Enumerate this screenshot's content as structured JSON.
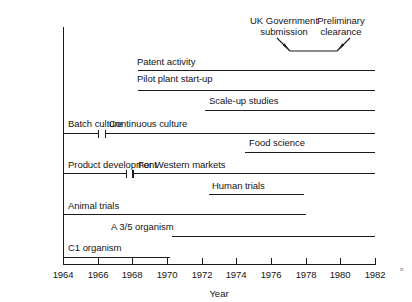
{
  "figure": {
    "axis": {
      "x_label": "Year",
      "x_min": 1964,
      "x_max": 1982,
      "ticks": [
        1964,
        1966,
        1968,
        1970,
        1972,
        1974,
        1976,
        1978,
        1980,
        1982
      ],
      "tick_labels": [
        "1964",
        "1966",
        "1968",
        "1970",
        "1972",
        "1974",
        "1976",
        "1978",
        "1980",
        "1982"
      ]
    },
    "annotations": [
      {
        "name": "uk-government-submission",
        "text": "UK Government\nsubmission",
        "at_year": 1976.7
      },
      {
        "name": "preliminary-clearance",
        "text": "Preliminary\nclearance",
        "at_year": 1980.0
      }
    ],
    "corner_mark": "¤"
  },
  "chart_data": {
    "type": "bar",
    "orientation": "horizontal-timeline",
    "title": "",
    "xlabel": "Year",
    "ylabel": "",
    "xlim": [
      1964,
      1982
    ],
    "grid": false,
    "legend": "none",
    "tasks": [
      {
        "label": "Patent activity",
        "start": 1968.3,
        "end": 1982.0,
        "cap_start": false,
        "cap_end": false
      },
      {
        "label": "Pilot plant start-up",
        "start": 1968.3,
        "end": 1982.0,
        "cap_start": false,
        "cap_end": false
      },
      {
        "label": "Scale-up studies",
        "start": 1972.2,
        "end": 1982.0,
        "cap_start": false,
        "cap_end": false
      },
      {
        "label": "Batch culture",
        "start": 1964.0,
        "end": 1966.1,
        "cap_start": false,
        "cap_end": true
      },
      {
        "label": "Continuous culture",
        "start": 1966.4,
        "end": 1982.0,
        "cap_start": true,
        "cap_end": false
      },
      {
        "label": "Food science",
        "start": 1974.5,
        "end": 1982.0,
        "cap_start": false,
        "cap_end": false
      },
      {
        "label": "Product development",
        "start": 1964.0,
        "end": 1967.7,
        "cap_start": false,
        "cap_end": true
      },
      {
        "label": "For Western markets",
        "start": 1968.0,
        "end": 1982.0,
        "cap_start": true,
        "cap_end": false
      },
      {
        "label": "Human trials",
        "start": 1972.4,
        "end": 1977.9,
        "cap_start": false,
        "cap_end": false
      },
      {
        "label": "Animal trials",
        "start": 1964.0,
        "end": 1978.0,
        "cap_start": false,
        "cap_end": false
      },
      {
        "label": "A 3/5 organism",
        "start": 1970.3,
        "end": 1982.0,
        "cap_start": false,
        "cap_end": false
      },
      {
        "label": "C1 organism",
        "start": 1964.0,
        "end": 1970.2,
        "cap_start": false,
        "cap_end": false
      }
    ],
    "annotation_bracket": {
      "left_year": 1976.7,
      "right_year": 1980.0,
      "label_left": "UK Government submission",
      "label_right": "Preliminary clearance"
    }
  }
}
